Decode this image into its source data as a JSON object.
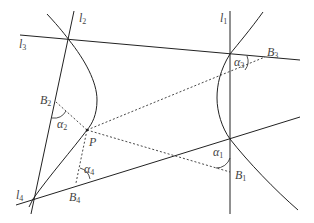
{
  "diagram": {
    "type": "geometry",
    "colors": {
      "line": "#222222",
      "dotted": "#333333",
      "label": "#444444",
      "background": "#ffffff"
    },
    "labels": {
      "l1": {
        "main": "l",
        "sub": "1"
      },
      "l2": {
        "main": "l",
        "sub": "2"
      },
      "l3": {
        "main": "l",
        "sub": "3"
      },
      "l4": {
        "main": "l",
        "sub": "4"
      },
      "B1": {
        "main": "B",
        "sub": "1"
      },
      "B2": {
        "main": "B",
        "sub": "2"
      },
      "B3": {
        "main": "B",
        "sub": "3"
      },
      "B4": {
        "main": "B",
        "sub": "4"
      },
      "P": {
        "main": "P"
      },
      "a1": {
        "main": "α",
        "sub": "1"
      },
      "a2": {
        "main": "α",
        "sub": "2"
      },
      "a3": {
        "main": "α",
        "sub": "3"
      },
      "a4": {
        "main": "α",
        "sub": "4"
      }
    }
  }
}
